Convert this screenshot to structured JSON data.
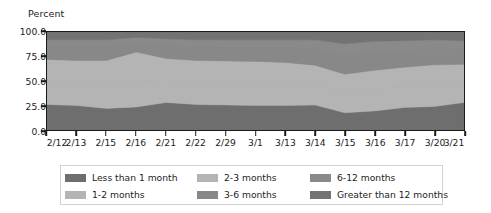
{
  "chart_data": {
    "type": "area",
    "title": "",
    "subtitle": "",
    "ylabel": "Percent",
    "xlabel": "",
    "ylim": [
      0,
      100
    ],
    "grid": false,
    "stacked": true,
    "normalized_percent": true,
    "legend_position": "bottom",
    "legend_columns": 3,
    "ytick_labels": [
      "0.0",
      "25.0",
      "50.0",
      "75.0",
      "100.0"
    ],
    "ytick_values": [
      0,
      25,
      50,
      75,
      100
    ],
    "categories": [
      "2/12",
      "2/13",
      "2/15",
      "2/16",
      "2/21",
      "2/22",
      "2/29",
      "3/1",
      "3/13",
      "3/14",
      "3/15",
      "3/16",
      "3/17",
      "3/20",
      "3/21"
    ],
    "series": [
      {
        "name": "Less than 1 month",
        "color": "#6e6e6e",
        "values": [
          26.0,
          25.0,
          22.0,
          23.5,
          28.0,
          26.0,
          25.5,
          25.0,
          25.0,
          25.5,
          17.5,
          19.5,
          23.0,
          24.0,
          28.0
        ]
      },
      {
        "name": "1-2 months",
        "color": "#b4b4b4",
        "values": [
          24.0,
          25.0,
          26.5,
          27.0,
          22.0,
          23.0,
          23.5,
          24.0,
          23.0,
          20.0,
          20.5,
          22.5,
          21.0,
          21.5,
          20.0
        ]
      },
      {
        "name": "2-3 months",
        "color": "#b4b4b4",
        "values": [
          22.0,
          21.0,
          22.5,
          29.0,
          23.0,
          22.0,
          21.5,
          21.0,
          21.0,
          20.5,
          19.0,
          19.0,
          20.0,
          21.0,
          19.0
        ]
      },
      {
        "name": "3-6 months",
        "color": "#888888",
        "values": [
          14.0,
          15.0,
          15.0,
          9.5,
          14.0,
          15.0,
          15.0,
          15.5,
          16.0,
          18.0,
          20.0,
          19.0,
          18.0,
          17.0,
          16.0
        ]
      },
      {
        "name": "6-12 months",
        "color": "#8a8a8a",
        "values": [
          6.0,
          6.0,
          6.0,
          5.5,
          6.0,
          6.0,
          6.5,
          6.5,
          7.0,
          8.0,
          11.0,
          10.5,
          9.0,
          8.5,
          8.0
        ]
      },
      {
        "name": "Greater than 12 months",
        "color": "#737373",
        "values": [
          8.0,
          8.0,
          8.0,
          5.5,
          7.0,
          8.0,
          8.0,
          8.0,
          8.0,
          8.0,
          12.0,
          9.5,
          9.0,
          8.0,
          9.0
        ]
      }
    ]
  },
  "legend": {
    "entries": [
      {
        "label": "Less than 1 month",
        "color": "#6e6e6e"
      },
      {
        "label": "2-3 months",
        "color": "#b4b4b4"
      },
      {
        "label": "6-12 months",
        "color": "#8a8a8a"
      },
      {
        "label": "1-2 months",
        "color": "#b4b4b4"
      },
      {
        "label": "3-6 months",
        "color": "#888888"
      },
      {
        "label": "Greater than 12 months",
        "color": "#737373"
      }
    ]
  },
  "style": {
    "axis_color": "#1a1a1a",
    "text_color": "#1c1c1c",
    "background": "#ffffff",
    "legend_border": "#d2d2d2"
  }
}
